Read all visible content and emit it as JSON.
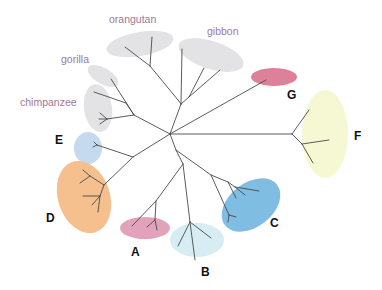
{
  "diagram": {
    "type": "unrooted phylogenetic tree",
    "species_labels": {
      "orangutan": "orangutan",
      "gibbon": "gibbon",
      "gorilla": "gorilla",
      "chimpanzee": "chimpanzee"
    },
    "clade_labels": {
      "A": "A",
      "B": "B",
      "C": "C",
      "D": "D",
      "E": "E",
      "F": "F",
      "G": "G"
    },
    "colors": {
      "branch": "#4a4a4a",
      "species_label": "#a0789a",
      "clade_label": "#111111",
      "primate_highlight": "#e3e3e6",
      "A": "#e2a3ba",
      "B": "#d6eef3",
      "C": "#7fbde3",
      "D": "#f5c08e",
      "E": "#c5d9ef",
      "F": "#f6f8d4",
      "G": "#d9738f"
    }
  }
}
